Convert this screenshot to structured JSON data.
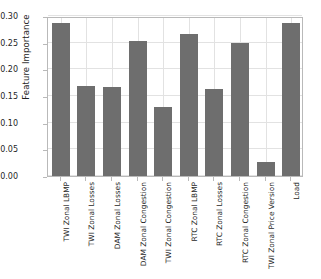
{
  "chart_data": {
    "type": "bar",
    "title": "",
    "xlabel": "",
    "ylabel": "Feature Importance",
    "ylim": [
      0.0,
      0.3
    ],
    "yticks": [
      "0.00",
      "0.05",
      "0.10",
      "0.15",
      "0.20",
      "0.25",
      "0.30"
    ],
    "ytick_values": [
      0.0,
      0.05,
      0.1,
      0.15,
      0.2,
      0.25,
      0.3
    ],
    "grid": true,
    "legend": null,
    "bar_color": "#6e6e6e",
    "categories": [
      "TWI Zonal LBMP",
      "TWI Zonal Losses",
      "DAM Zonal Losses",
      "DAM Zonal Congestion",
      "TWI Zonal Congestion",
      "RTC Zonal LBMP",
      "RTC Zonal Losses",
      "RTC Zonal Congestion",
      "TWI Zonal Price Version",
      "Load"
    ],
    "values": [
      0.286,
      0.168,
      0.166,
      0.254,
      0.13,
      0.266,
      0.163,
      0.25,
      0.027,
      0.286
    ]
  },
  "figure": {
    "background": "#ffffff",
    "frame_color": "#b9b9b9",
    "grid_color": "#e2e2e2"
  }
}
